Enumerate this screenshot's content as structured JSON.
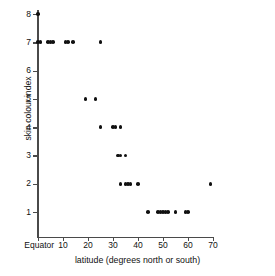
{
  "chart_data": {
    "type": "scatter",
    "title": "",
    "xlabel": "latitude (degrees north or south)",
    "ylabel": "skin colour index",
    "xlim": [
      0,
      70
    ],
    "ylim": [
      0.5,
      8.4
    ],
    "grid": false,
    "legend": "none",
    "xticks": [
      0,
      10,
      20,
      30,
      40,
      50,
      60,
      70
    ],
    "xticklabels": [
      "Equator",
      "10",
      "20",
      "30",
      "40",
      "50",
      "60",
      "70"
    ],
    "yticks": [
      1,
      2,
      3,
      4,
      5,
      6,
      7,
      8
    ],
    "yticklabels": [
      "1",
      "2",
      "3",
      "4",
      "5",
      "6",
      "7",
      "8"
    ],
    "marker": "filled-circle",
    "marker_color": "#111111",
    "points": [
      {
        "x": 0,
        "y": 8
      },
      {
        "x": 0,
        "y": 7
      },
      {
        "x": 1,
        "y": 7
      },
      {
        "x": 4,
        "y": 7
      },
      {
        "x": 5,
        "y": 7
      },
      {
        "x": 6,
        "y": 7
      },
      {
        "x": 11,
        "y": 7
      },
      {
        "x": 12,
        "y": 7
      },
      {
        "x": 14,
        "y": 7
      },
      {
        "x": 25,
        "y": 7
      },
      {
        "x": 19,
        "y": 5
      },
      {
        "x": 23,
        "y": 5
      },
      {
        "x": 25,
        "y": 4
      },
      {
        "x": 30,
        "y": 4
      },
      {
        "x": 31,
        "y": 4
      },
      {
        "x": 33,
        "y": 4
      },
      {
        "x": 32,
        "y": 3
      },
      {
        "x": 33,
        "y": 3
      },
      {
        "x": 35,
        "y": 3
      },
      {
        "x": 33,
        "y": 2
      },
      {
        "x": 35,
        "y": 2
      },
      {
        "x": 36,
        "y": 2
      },
      {
        "x": 37,
        "y": 2
      },
      {
        "x": 40,
        "y": 2
      },
      {
        "x": 69,
        "y": 2
      },
      {
        "x": 44,
        "y": 1
      },
      {
        "x": 48,
        "y": 1
      },
      {
        "x": 49,
        "y": 1
      },
      {
        "x": 50,
        "y": 1
      },
      {
        "x": 51,
        "y": 1
      },
      {
        "x": 52,
        "y": 1
      },
      {
        "x": 55,
        "y": 1
      },
      {
        "x": 59,
        "y": 1
      },
      {
        "x": 60,
        "y": 1
      }
    ]
  },
  "axes": {
    "y_title": "skin colour index",
    "x_title": "latitude (degrees north or south)"
  }
}
